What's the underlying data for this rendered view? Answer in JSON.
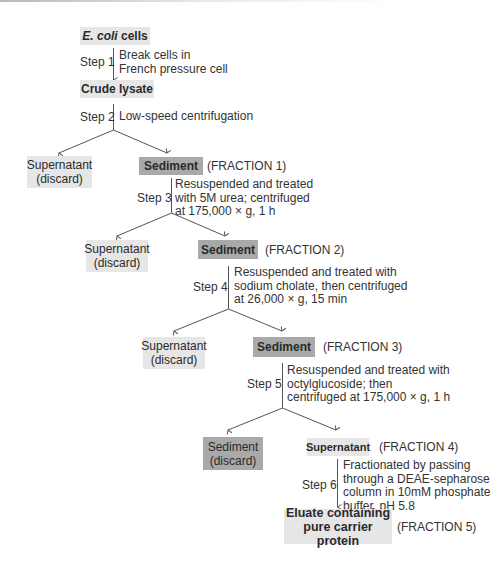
{
  "colors": {
    "light_box": "#e6e6e6",
    "dark_box": "#a9a9a9",
    "line": "#555555",
    "text": "#333333"
  },
  "nodes": {
    "ecoli": {
      "italic": "E. coli",
      "rest": " cells"
    },
    "crude": {
      "label": "Crude lysate"
    },
    "sup1": {
      "line1": "Supernatant",
      "line2": "(discard)"
    },
    "sed1": {
      "label": "Sediment",
      "fraction": "(FRACTION 1)"
    },
    "sup2": {
      "line1": "Supernatant",
      "line2": "(discard)"
    },
    "sed2": {
      "label": "Sediment",
      "fraction": "(FRACTION 2)"
    },
    "sup3": {
      "line1": "Supernatant",
      "line2": "(discard)"
    },
    "sed3": {
      "label": "Sediment",
      "fraction": "(FRACTION 3)"
    },
    "sed4": {
      "line1": "Sediment",
      "line2": "(discard)"
    },
    "sup4": {
      "label": "Supernatant",
      "fraction": "(FRACTION 4)"
    },
    "eluate": {
      "line1": "Eluate containing",
      "line2": "pure carrier protein",
      "fraction": "(FRACTION 5)"
    }
  },
  "steps": [
    {
      "label": "Step 1",
      "lines": [
        "Break cells in",
        "French pressure cell"
      ]
    },
    {
      "label": "Step 2",
      "lines": [
        "Low-speed centrifugation"
      ]
    },
    {
      "label": "Step 3",
      "lines": [
        "Resuspended and treated",
        "with 5M urea;  centrifuged",
        "at 175,000 × g,  1 h"
      ]
    },
    {
      "label": "Step 4",
      "lines": [
        "Resuspended and treated with",
        "sodium cholate,  then centrifuged",
        "at 26,000 × g, 15 min"
      ]
    },
    {
      "label": "Step 5",
      "lines": [
        "Resuspended and treated with",
        "octylglucoside;  then",
        "centrifuged at 175,000 × g, 1 h"
      ]
    },
    {
      "label": "Step 6",
      "lines": [
        "Fractionated by passing",
        "through a DEAE-sepharose",
        "column in 10mM phosphate",
        "buffer,  pH 5.8"
      ]
    }
  ]
}
